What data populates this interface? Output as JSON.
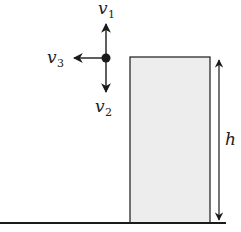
{
  "diagram": {
    "colors": {
      "stroke": "#1a1a1a",
      "box_fill": "#ededed",
      "background": "#ffffff"
    },
    "particle": {
      "x": 106,
      "y": 58,
      "vectors": [
        {
          "name": "v1",
          "label": "v",
          "subscript": "1",
          "direction": "up"
        },
        {
          "name": "v2",
          "label": "v",
          "subscript": "2",
          "direction": "down"
        },
        {
          "name": "v3",
          "label": "v",
          "subscript": "3",
          "direction": "left"
        }
      ]
    },
    "building": {
      "x": 130,
      "y": 57,
      "width": 80,
      "height": 165
    },
    "height_marker": {
      "label": "h"
    },
    "ground": {
      "y": 223
    }
  }
}
